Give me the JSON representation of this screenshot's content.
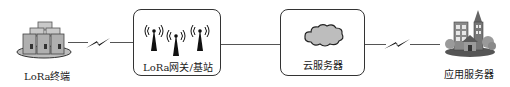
{
  "diagram": {
    "title": "",
    "nodes": [
      {
        "id": "terminal",
        "label": "LoRa终端",
        "icon": "server-stack-icon"
      },
      {
        "id": "gateway",
        "label": "LoRa网关/基站",
        "icon": "antenna-tower-icon"
      },
      {
        "id": "cloud",
        "label": "云服务器",
        "icon": "cloud-icon"
      },
      {
        "id": "app",
        "label": "应用服务器",
        "icon": "buildings-icon"
      }
    ],
    "edges": [
      {
        "from": "terminal",
        "to": "gateway",
        "type": "wireless"
      },
      {
        "from": "gateway",
        "to": "cloud",
        "type": "wired"
      },
      {
        "from": "cloud",
        "to": "app",
        "type": "wireless"
      }
    ]
  }
}
